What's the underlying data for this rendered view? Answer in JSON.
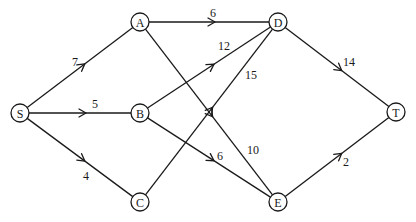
{
  "diagram": {
    "type": "flow-network",
    "nodes": [
      {
        "id": "S",
        "label": "S",
        "x": 20,
        "y": 113
      },
      {
        "id": "A",
        "label": "A",
        "x": 140,
        "y": 22
      },
      {
        "id": "B",
        "label": "B",
        "x": 140,
        "y": 113
      },
      {
        "id": "C",
        "label": "C",
        "x": 140,
        "y": 202
      },
      {
        "id": "D",
        "label": "D",
        "x": 278,
        "y": 22
      },
      {
        "id": "E",
        "label": "E",
        "x": 278,
        "y": 202
      },
      {
        "id": "T",
        "label": "T",
        "x": 396,
        "y": 112
      }
    ],
    "edges": [
      {
        "from": "S",
        "to": "A",
        "capacity": "7",
        "lx": 72,
        "ly": 66
      },
      {
        "from": "S",
        "to": "B",
        "capacity": "5",
        "lx": 92,
        "ly": 108
      },
      {
        "from": "S",
        "to": "C",
        "capacity": "4",
        "lx": 83,
        "ly": 180
      },
      {
        "from": "A",
        "to": "D",
        "capacity": "6",
        "lx": 210,
        "ly": 17
      },
      {
        "from": "A",
        "to": "E",
        "capacity": "10",
        "lx": 247,
        "ly": 154
      },
      {
        "from": "B",
        "to": "D",
        "capacity": "12",
        "lx": 218,
        "ly": 50
      },
      {
        "from": "B",
        "to": "E",
        "capacity": "6",
        "lx": 217,
        "ly": 160
      },
      {
        "from": "C",
        "to": "D",
        "capacity": "15",
        "lx": 245,
        "ly": 79
      },
      {
        "from": "D",
        "to": "T",
        "capacity": "14",
        "lx": 343,
        "ly": 66
      },
      {
        "from": "E",
        "to": "T",
        "capacity": "2",
        "lx": 343,
        "ly": 166
      }
    ]
  }
}
